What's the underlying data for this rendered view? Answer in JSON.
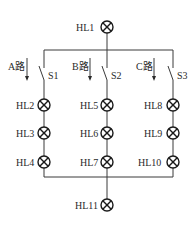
{
  "diagram": {
    "type": "circuit-schematic",
    "lamps": {
      "top": "HL1",
      "branchA": [
        "HL2",
        "HL3",
        "HL4"
      ],
      "branchB": [
        "HL5",
        "HL6",
        "HL7"
      ],
      "branchC": [
        "HL8",
        "HL9",
        "HL10"
      ],
      "bottom": "HL11"
    },
    "switches": [
      "S1",
      "S2",
      "S3"
    ],
    "branch_labels": [
      "A路",
      "B路",
      "C路"
    ],
    "colors": {
      "line": "#3a3a3a",
      "lamp": "#1a1a1a",
      "background": "#ffffff"
    }
  }
}
